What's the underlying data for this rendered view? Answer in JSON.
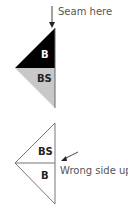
{
  "diagram": {
    "top": {
      "annotation": "Seam here",
      "upper_label": "B",
      "lower_label": "BS",
      "upper_fill": "#000000",
      "lower_fill": "#c8c8c8"
    },
    "bottom": {
      "annotation": "Wrong side up",
      "upper_label": "BS",
      "lower_label": "B",
      "fill": "#ffffff"
    }
  }
}
